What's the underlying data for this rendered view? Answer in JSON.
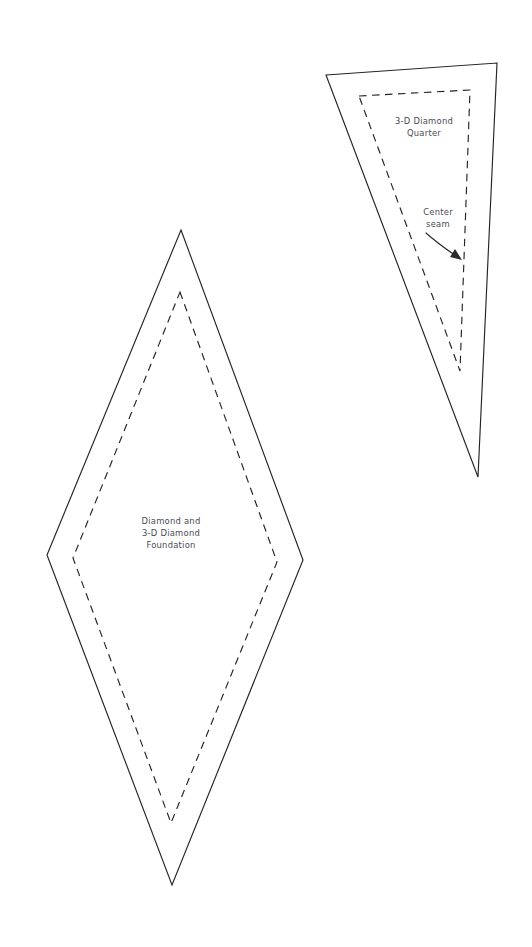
{
  "document": {
    "type": "quilting-template-pattern-sheet",
    "background_color": "#ffffff",
    "line_color": "#23232a",
    "text_color": "#4a4a52",
    "width": 532,
    "height": 947
  },
  "pieces": [
    {
      "id": "diamond-foundation",
      "name": "Diamond and 3-D Diamond Foundation",
      "label_lines": [
        "Diamond and",
        "3-D Diamond",
        "Foundation"
      ],
      "label_position": {
        "x": 171,
        "y": 532
      },
      "label_line_height": 12,
      "cut_line_points": "181,230 303,560 172,885 47,555",
      "seam_line_points": "180,292 277,562 171,823 73,558"
    },
    {
      "id": "diamond-quarter",
      "name": "3-D Diamond Quarter",
      "label_lines": [
        "3-D Diamond",
        "Quarter"
      ],
      "label_position": {
        "x": 424,
        "y": 121
      },
      "label_line_height": 12,
      "cut_line_points": "326,75 497,63 478,477",
      "seam_line_points": "359,96 470,90 460,371"
    }
  ],
  "annotations": [
    {
      "id": "center-seam",
      "label_lines": [
        "Center",
        "seam"
      ],
      "label_position": {
        "x": 438,
        "y": 212
      },
      "label_line_height": 12,
      "arrow_path": "M 426,233 C 437,243 446,249 459,258",
      "arrow_head_points": "462,260 450,257 455,249"
    }
  ]
}
